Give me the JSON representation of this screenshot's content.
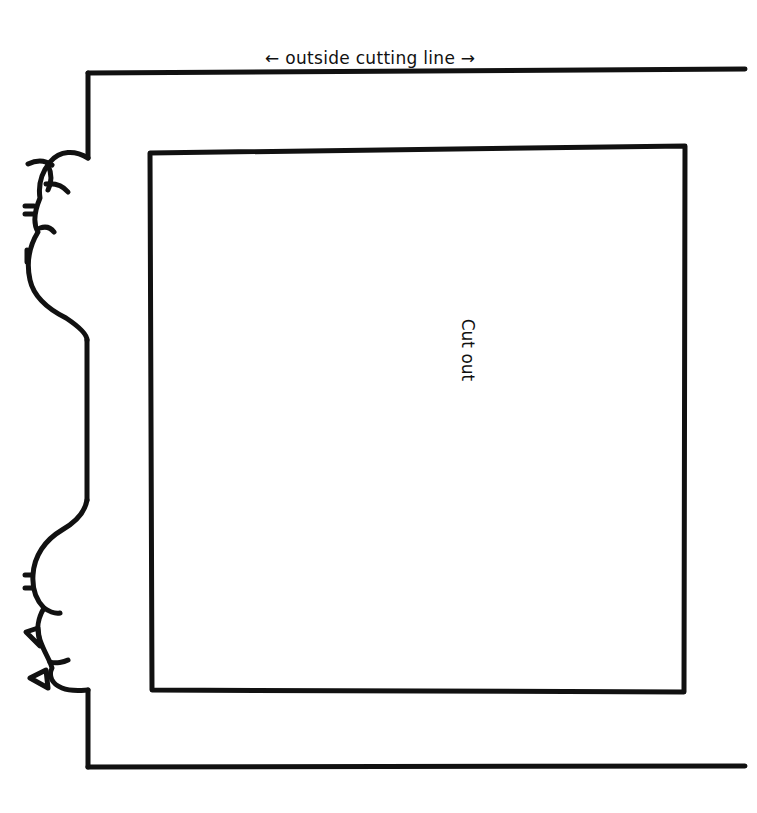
{
  "diagram": {
    "top_label": "← outside cutting line →",
    "center_label": "Cut out",
    "line_color": "#111111",
    "background": "#ffffff"
  }
}
